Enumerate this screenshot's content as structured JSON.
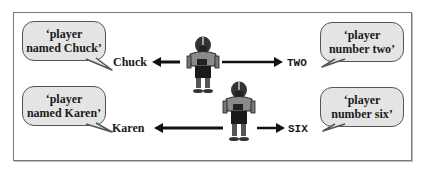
{
  "bubbles": {
    "top_left": {
      "line1": "‘player",
      "line2": "named Chuck’"
    },
    "top_right": {
      "line1": "‘player",
      "line2": "number two’"
    },
    "bottom_left": {
      "line1": "‘player",
      "line2": "named Karen’"
    },
    "bottom_right": {
      "line1": "‘player",
      "line2": "number six’"
    }
  },
  "labels": {
    "name_top": "Chuck",
    "code_top": "TWO",
    "name_bottom": "Karen",
    "code_bottom": "SIX"
  },
  "icons": {
    "player_top": "football-player-icon",
    "player_bottom": "football-player-icon"
  },
  "colors": {
    "bubble_fill": "#e4e4e4",
    "bubble_border": "#555555",
    "frame_border": "#7a7a7a",
    "text": "#1a1a1a"
  }
}
